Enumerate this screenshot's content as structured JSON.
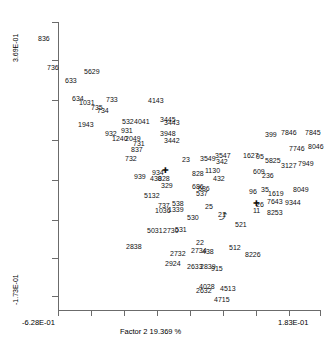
{
  "chart_data": {
    "type": "scatter",
    "title": "",
    "xlabel": "Factor 2 19.369 %",
    "ylabel": "",
    "x_tick_labels": [
      "-6.28E-01",
      "1.83E-01"
    ],
    "y_tick_labels": [
      "3.69E-01",
      "-1.73E-01"
    ],
    "xlim": [
      -0.628,
      0.183
    ],
    "ylim": [
      -0.173,
      0.369
    ],
    "grid": false,
    "legend": null,
    "point_label_style": "text-only labels at point positions",
    "points": [
      {
        "label": "836",
        "px": 38,
        "py": 35
      },
      {
        "label": "736",
        "px": 47,
        "py": 64
      },
      {
        "label": "5629",
        "px": 84,
        "py": 68
      },
      {
        "label": "633",
        "px": 65,
        "py": 77
      },
      {
        "label": "634",
        "px": 72,
        "py": 95
      },
      {
        "label": "1031",
        "px": 79,
        "py": 99
      },
      {
        "label": "733",
        "px": 106,
        "py": 96
      },
      {
        "label": "4143",
        "px": 148,
        "py": 97
      },
      {
        "label": "735",
        "px": 91,
        "py": 104
      },
      {
        "label": "734",
        "px": 97,
        "py": 107
      },
      {
        "label": "1943",
        "px": 78,
        "py": 121
      },
      {
        "label": "532",
        "px": 122,
        "py": 118
      },
      {
        "label": "4041",
        "px": 134,
        "py": 118
      },
      {
        "label": "3445",
        "px": 160,
        "py": 116
      },
      {
        "label": "3443",
        "px": 164,
        "py": 119
      },
      {
        "label": "932",
        "px": 105,
        "py": 130
      },
      {
        "label": "931",
        "px": 121,
        "py": 127
      },
      {
        "label": "1240",
        "px": 112,
        "py": 135
      },
      {
        "label": "2049",
        "px": 125,
        "py": 135
      },
      {
        "label": "3948",
        "px": 160,
        "py": 130
      },
      {
        "label": "3442",
        "px": 164,
        "py": 137
      },
      {
        "label": "731",
        "px": 133,
        "py": 140
      },
      {
        "label": "837",
        "px": 131,
        "py": 146
      },
      {
        "label": "732",
        "px": 125,
        "py": 155
      },
      {
        "label": "23",
        "px": 182,
        "py": 156
      },
      {
        "label": "3549",
        "px": 200,
        "py": 155
      },
      {
        "label": "3547",
        "px": 215,
        "py": 152
      },
      {
        "label": "342",
        "px": 216,
        "py": 158
      },
      {
        "label": "1627",
        "px": 243,
        "py": 152
      },
      {
        "label": "95",
        "px": 256,
        "py": 153
      },
      {
        "label": "5825",
        "px": 265,
        "py": 157
      },
      {
        "label": "399",
        "px": 265,
        "py": 131
      },
      {
        "label": "7846",
        "px": 281,
        "py": 129
      },
      {
        "label": "7845",
        "px": 305,
        "py": 129
      },
      {
        "label": "7746",
        "px": 289,
        "py": 145
      },
      {
        "label": "8046",
        "px": 308,
        "py": 143
      },
      {
        "label": "3127",
        "px": 281,
        "py": 162
      },
      {
        "label": "7949",
        "px": 298,
        "py": 160
      },
      {
        "label": "939",
        "px": 134,
        "py": 173
      },
      {
        "label": "934",
        "px": 152,
        "py": 169
      },
      {
        "label": "430",
        "px": 150,
        "py": 175
      },
      {
        "label": "828",
        "px": 158,
        "py": 175
      },
      {
        "label": "329",
        "px": 161,
        "py": 182
      },
      {
        "label": "828b",
        "px": 192,
        "py": 170
      },
      {
        "label": "1130",
        "px": 205,
        "py": 167
      },
      {
        "label": "432",
        "px": 213,
        "py": 175
      },
      {
        "label": "609",
        "px": 253,
        "py": 168
      },
      {
        "label": "236",
        "px": 262,
        "py": 172
      },
      {
        "label": "5132",
        "px": 144,
        "py": 192
      },
      {
        "label": "686",
        "px": 192,
        "py": 183
      },
      {
        "label": "686b",
        "px": 198,
        "py": 185
      },
      {
        "label": "537",
        "px": 196,
        "py": 190
      },
      {
        "label": "96",
        "px": 249,
        "py": 188
      },
      {
        "label": "35",
        "px": 261,
        "py": 186
      },
      {
        "label": "1619",
        "px": 268,
        "py": 190
      },
      {
        "label": "8049",
        "px": 293,
        "py": 186
      },
      {
        "label": "737",
        "px": 158,
        "py": 202
      },
      {
        "label": "538",
        "px": 172,
        "py": 200
      },
      {
        "label": "1036",
        "px": 155,
        "py": 207
      },
      {
        "label": "1339",
        "px": 168,
        "py": 206
      },
      {
        "label": "25",
        "px": 205,
        "py": 203
      },
      {
        "label": "26",
        "px": 256,
        "py": 201
      },
      {
        "label": "11",
        "px": 253,
        "py": 207
      },
      {
        "label": "7643",
        "px": 267,
        "py": 198
      },
      {
        "label": "9344",
        "px": 285,
        "py": 199
      },
      {
        "label": "8253",
        "px": 267,
        "py": 209
      },
      {
        "label": "530",
        "px": 187,
        "py": 214
      },
      {
        "label": "21",
        "px": 218,
        "py": 211
      },
      {
        "label": "5031",
        "px": 147,
        "py": 227
      },
      {
        "label": "2730",
        "px": 163,
        "py": 227
      },
      {
        "label": "531",
        "px": 175,
        "py": 226
      },
      {
        "label": "521",
        "px": 235,
        "py": 221
      },
      {
        "label": "2838",
        "px": 126,
        "py": 243
      },
      {
        "label": "22",
        "px": 196,
        "py": 239
      },
      {
        "label": "2734",
        "px": 191,
        "py": 247
      },
      {
        "label": "438",
        "px": 202,
        "py": 248
      },
      {
        "label": "512",
        "px": 229,
        "py": 244
      },
      {
        "label": "2732",
        "px": 170,
        "py": 250
      },
      {
        "label": "8226",
        "px": 245,
        "py": 251
      },
      {
        "label": "2924",
        "px": 165,
        "py": 260
      },
      {
        "label": "2633",
        "px": 187,
        "py": 263
      },
      {
        "label": "2839",
        "px": 200,
        "py": 263
      },
      {
        "label": "915",
        "px": 211,
        "py": 265
      },
      {
        "label": "4028",
        "px": 199,
        "py": 283
      },
      {
        "label": "2632",
        "px": 196,
        "py": 287
      },
      {
        "label": "4513",
        "px": 220,
        "py": 285
      },
      {
        "label": "4715",
        "px": 214,
        "py": 296
      }
    ],
    "markers": [
      {
        "name": "cross-marker",
        "px": 162,
        "py": 167
      },
      {
        "name": "cross-marker",
        "px": 253,
        "py": 200
      },
      {
        "name": "arrow-marker",
        "px": 219,
        "py": 213
      }
    ],
    "y_tick_positions": [
      22,
      60,
      100,
      140,
      180,
      220,
      258,
      296
    ],
    "x_tick_positions": [
      58,
      91,
      124,
      157,
      190,
      223,
      256,
      289,
      320
    ]
  }
}
